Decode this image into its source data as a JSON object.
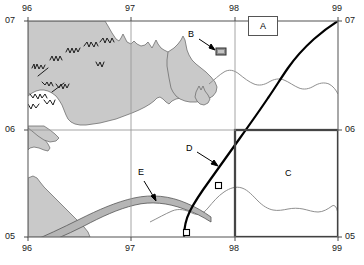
{
  "figure": {
    "type": "topographic-map",
    "width": 364,
    "height": 265,
    "background": "#ffffff"
  },
  "axes": {
    "x_ticks_top": [
      "96",
      "97",
      "98",
      "99"
    ],
    "x_ticks_bottom": [
      "96",
      "97",
      "98",
      "99"
    ],
    "y_ticks_left": [
      "07",
      "06",
      "05"
    ],
    "y_ticks_right": [
      "07",
      "06",
      "05"
    ],
    "x_tick_positions": [
      28,
      131,
      235,
      338
    ],
    "y_tick_positions": [
      21,
      130,
      237
    ],
    "grid_color": "#9a9a9a",
    "frame_color": "#6f6f6f"
  },
  "annotations": {
    "a": {
      "label": "A",
      "kind": "boxed-label",
      "x": 248,
      "y": 16,
      "w": 28,
      "h": 18
    },
    "b": {
      "label": "B",
      "kind": "arrow-label",
      "x": 188,
      "y": 34,
      "target_x": 216,
      "target_y": 50
    },
    "c": {
      "label": "C",
      "kind": "plain-label",
      "x": 285,
      "y": 173
    },
    "d": {
      "label": "D",
      "kind": "arrow-label",
      "x": 186,
      "y": 148,
      "target_x": 219,
      "target_y": 165
    },
    "e": {
      "label": "E",
      "kind": "arrow-label",
      "x": 139,
      "y": 172,
      "target_x": 155,
      "target_y": 202
    }
  },
  "features": {
    "landmass_fill": "#c9c9c9",
    "landmass_stroke": "#6e6e6e",
    "building_marker": {
      "name": "building-b",
      "fill": "#8e8e8e",
      "stroke": "#3a3a3a",
      "x": 216,
      "y": 48,
      "w": 10,
      "h": 7
    },
    "study_area_box": {
      "name": "study-area-c",
      "stroke": "#000000",
      "stroke_width": 2,
      "x": 235,
      "y": 130,
      "w": 103,
      "h": 107
    },
    "thick_route": {
      "name": "route-d",
      "stroke": "#000000",
      "stroke_width": 2
    },
    "river_band": {
      "name": "river-e",
      "fill": "#b5b5b5",
      "stroke": "#555555"
    },
    "contour_line": {
      "name": "contour",
      "stroke": "#8a8a8a",
      "stroke_width": 1
    },
    "station_markers": [
      {
        "name": "station-marker",
        "x": 219,
        "y": 186
      },
      {
        "name": "station-marker",
        "x": 187,
        "y": 233
      }
    ]
  }
}
